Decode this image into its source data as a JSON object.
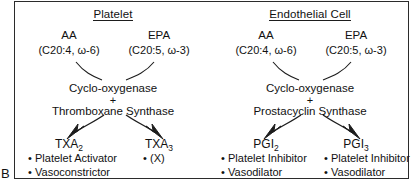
{
  "figure": {
    "panel_letter": "B",
    "panels": [
      {
        "id": "platelet",
        "title": "Platelet",
        "substrates": [
          {
            "name": "AA",
            "formula": "(C20:4, ω-6)"
          },
          {
            "name": "EPA",
            "formula": "(C20:5, ω-3)"
          }
        ],
        "enzymes": {
          "first": "Cyclo-oxygenase",
          "operator": "+",
          "second": "Thromboxane Synthase"
        },
        "products": [
          {
            "label": "TXA",
            "subscript": "2",
            "effects": [
              "Platelet Activator",
              "Vasoconstrictor"
            ]
          },
          {
            "label": "TXA",
            "subscript": "3",
            "effects": [
              "(X)"
            ]
          }
        ]
      },
      {
        "id": "endothelial",
        "title": "Endothelial Cell",
        "substrates": [
          {
            "name": "AA",
            "formula": "(C20:4, ω-6)"
          },
          {
            "name": "EPA",
            "formula": "(C20:5, ω-3)"
          }
        ],
        "enzymes": {
          "first": "Cyclo-oxygenase",
          "operator": "+",
          "second": "Prostacyclin Synthase"
        },
        "products": [
          {
            "label": "PGI",
            "subscript": "2",
            "effects": [
              "Platelet Inhibitor",
              "Vasodilator"
            ]
          },
          {
            "label": "PGI",
            "subscript": "3",
            "effects": [
              "Platelet Inhibitor",
              "Vasodilator"
            ]
          }
        ]
      }
    ],
    "bullet_glyph": "•",
    "colors": {
      "ink": "#111111",
      "frame": "#2b2b2b",
      "background": "#ffffff"
    }
  }
}
